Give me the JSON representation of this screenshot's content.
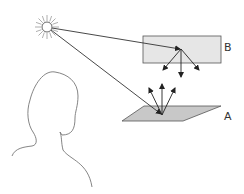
{
  "diagram": {
    "type": "light-reflection-illustration",
    "labels": {
      "surface_a": "A",
      "surface_b": "B"
    },
    "elements": {
      "light_source": "sun-icon",
      "observer": "person-silhouette",
      "surface_a": "horizontal-plane-parallelogram",
      "surface_b": "rectangular-panel"
    },
    "colors": {
      "stroke": "#333333",
      "surface_fill": "#cccccc",
      "panel_fill": "#e6e6e6",
      "sun_rays": "#999999",
      "silhouette": "#777777"
    }
  }
}
